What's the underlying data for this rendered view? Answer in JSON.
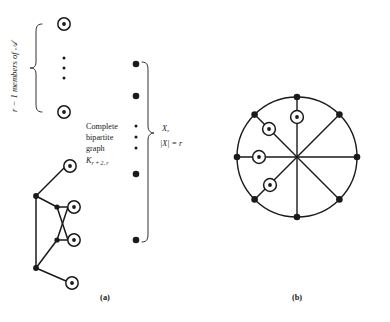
{
  "figure": {
    "panels": [
      {
        "id": "a",
        "caption": "(a)",
        "labels": {
          "left_brace_label": "r − 1 members of 𝒜",
          "left_brace_label_plain": "r - 1 members of A",
          "center_line1": "Complete",
          "center_line2": "bipartite",
          "center_line3": "graph",
          "center_graph_symbol": "K",
          "center_graph_subscript": "r + 2, r",
          "right_set_label": "X,",
          "right_set_size": "|X| = r"
        },
        "left_column_circled_nodes": 5,
        "left_column_ellipsis_dots": 3,
        "middle_column_filled_nodes": 4,
        "middle_column_ellipsis_dots": 3
      },
      {
        "id": "b",
        "caption": "(b)",
        "wheel": {
          "spokes": 8,
          "rim_nodes": 8,
          "circled_nodes": 4
        }
      }
    ]
  },
  "colors": {
    "stroke": "#1a1a1a",
    "fill_node": "#1a1a1a",
    "background": "#ffffff"
  }
}
